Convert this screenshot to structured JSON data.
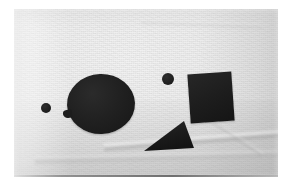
{
  "image": {
    "kind": "photograph",
    "subject": "dark geometric paper cut-out shapes arranged on a light woven fabric background",
    "alt_text": "Five dark cut-out shapes on pale cloth: two small dots, a large disc, a square and a triangle",
    "orientation": "landscape",
    "width_px": 295,
    "height_px": 194
  },
  "print": {
    "left_px": 14,
    "top_px": 9,
    "width_px": 264,
    "height_px": 168,
    "margin_color": "#ffffff"
  },
  "background": {
    "name": "woven cloth",
    "base_color": "#eaeaea",
    "highlight_color": "#f2f2f2",
    "shadow_color": "#d4d4d4",
    "texture": "fine woven weave with soft creases"
  },
  "palette": {
    "shape_dark": "#1d1d1d",
    "shape_highlight": "#2e2e2e",
    "shape_core": "#141414",
    "paper_light": "#f2f2f2",
    "paper_mid": "#eaeaea",
    "paper_dark": "#d4d4d4",
    "margin": "#ffffff"
  },
  "shapes": [
    {
      "id": "dot-left",
      "label": "Small circle (left)",
      "form": "circle",
      "color": "#1c1c1c",
      "center": {
        "x": 46,
        "y": 108
      },
      "size": {
        "width": 10,
        "height": 10
      },
      "rotation_deg": 0
    },
    {
      "id": "disc-large",
      "label": "Large disc",
      "form": "ellipse",
      "color": "#212121",
      "center": {
        "x": 101,
        "y": 104
      },
      "size": {
        "width": 68,
        "height": 60
      },
      "rotation_deg": -2,
      "note": "small tab protrudes from lower-left edge"
    },
    {
      "id": "disc-tab",
      "label": "Disc edge tab",
      "form": "nub",
      "color": "#1d1d1d",
      "center": {
        "x": 67,
        "y": 114
      },
      "size": {
        "width": 9,
        "height": 8
      },
      "rotation_deg": -8
    },
    {
      "id": "dot-mid",
      "label": "Small circle (upper middle)",
      "form": "circle",
      "color": "#1d1d1d",
      "center": {
        "x": 168,
        "y": 79
      },
      "size": {
        "width": 12,
        "height": 12
      },
      "rotation_deg": 0
    },
    {
      "id": "square",
      "label": "Square",
      "form": "square",
      "color": "#1d1d1d",
      "center": {
        "x": 211,
        "y": 97
      },
      "size": {
        "width": 44,
        "height": 49
      },
      "rotation_deg": -4
    },
    {
      "id": "triangle",
      "label": "Triangle",
      "form": "triangle",
      "color": "#1b1b1b",
      "center": {
        "x": 169,
        "y": 136
      },
      "size": {
        "width": 50,
        "height": 30
      },
      "rotation_deg": 0,
      "vertices": [
        {
          "x": 40,
          "y": 0
        },
        {
          "x": 50,
          "y": 27
        },
        {
          "x": 0,
          "y": 30
        }
      ]
    }
  ],
  "creases": [
    {
      "id": "crease-main",
      "label": "Main fold across lower cloth",
      "rotation_deg": -4.5
    },
    {
      "id": "crease-long",
      "label": "Long shallow fold near bottom",
      "rotation_deg": -1.6
    },
    {
      "id": "crease-diag",
      "label": "Short diagonal fold, lower right",
      "rotation_deg": 34
    },
    {
      "id": "crease-upper",
      "label": "Faint fold, upper right",
      "rotation_deg": 2
    }
  ]
}
